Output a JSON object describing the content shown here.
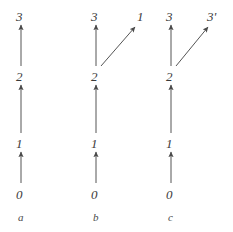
{
  "figure": {
    "background_color": "#ffffff",
    "stroke_color": "#555555",
    "text_color": "#3a3a3a",
    "width": 233,
    "height": 232,
    "panels": [
      {
        "id": "a",
        "caption": "a",
        "caption_x": 18,
        "caption_y": 212,
        "column_x": 21,
        "nodes": [
          {
            "label": "0",
            "x": 16,
            "y": 188
          },
          {
            "label": "1",
            "x": 16,
            "y": 137
          },
          {
            "label": "2",
            "x": 16,
            "y": 70
          },
          {
            "label": "3",
            "x": 16,
            "y": 10
          }
        ],
        "arrows": [
          {
            "name": "arrow-0-to-1",
            "x1": 21,
            "y1": 183,
            "x2": 21,
            "y2": 152
          },
          {
            "name": "arrow-1-to-2",
            "x1": 21,
            "y1": 133,
            "x2": 21,
            "y2": 85
          },
          {
            "name": "arrow-2-to-3",
            "x1": 21,
            "y1": 66,
            "x2": 21,
            "y2": 25
          }
        ]
      },
      {
        "id": "b",
        "caption": "b",
        "caption_x": 93,
        "caption_y": 212,
        "column_x": 96,
        "nodes": [
          {
            "label": "0",
            "x": 91,
            "y": 188
          },
          {
            "label": "1",
            "x": 91,
            "y": 137
          },
          {
            "label": "2",
            "x": 91,
            "y": 70
          },
          {
            "label": "3",
            "x": 91,
            "y": 10
          },
          {
            "label": "1",
            "x": 137,
            "y": 10
          }
        ],
        "arrows": [
          {
            "name": "arrow-0-to-1",
            "x1": 96,
            "y1": 183,
            "x2": 96,
            "y2": 152
          },
          {
            "name": "arrow-1-to-2",
            "x1": 96,
            "y1": 133,
            "x2": 96,
            "y2": 85
          },
          {
            "name": "arrow-2-to-3",
            "x1": 96,
            "y1": 66,
            "x2": 96,
            "y2": 25
          },
          {
            "name": "arrow-2-to-1-prime-diagonal",
            "x1": 101,
            "y1": 66,
            "x2": 135,
            "y2": 27
          }
        ]
      },
      {
        "id": "c",
        "caption": "c",
        "caption_x": 168,
        "caption_y": 212,
        "column_x": 171,
        "nodes": [
          {
            "label": "0",
            "x": 166,
            "y": 188
          },
          {
            "label": "1",
            "x": 166,
            "y": 137
          },
          {
            "label": "2",
            "x": 166,
            "y": 70
          },
          {
            "label": "3",
            "x": 166,
            "y": 10
          },
          {
            "label": "3'",
            "x": 207,
            "y": 10
          }
        ],
        "arrows": [
          {
            "name": "arrow-0-to-1",
            "x1": 171,
            "y1": 183,
            "x2": 171,
            "y2": 152
          },
          {
            "name": "arrow-1-to-2",
            "x1": 171,
            "y1": 133,
            "x2": 171,
            "y2": 85
          },
          {
            "name": "arrow-2-to-3",
            "x1": 171,
            "y1": 66,
            "x2": 171,
            "y2": 25
          },
          {
            "name": "arrow-2-to-3-prime-diagonal",
            "x1": 176,
            "y1": 66,
            "x2": 208,
            "y2": 27
          }
        ]
      }
    ]
  }
}
